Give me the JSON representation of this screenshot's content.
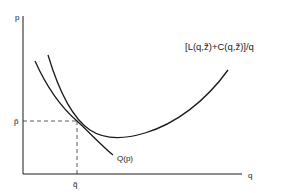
{
  "diagram": {
    "axes": {
      "y_label": "p",
      "x_label": "q"
    },
    "equilibrium": {
      "p_label": "p̃",
      "q_label": "q̃"
    },
    "curves": [
      {
        "id": "average-cost",
        "label": "[L(q,z̃)+C(q,z̃)]/q",
        "shape": "U-shaped"
      },
      {
        "id": "demand",
        "label": "Q(p)",
        "shape": "downward-sloping"
      }
    ],
    "colors": {
      "ink": "#1a1a1a",
      "background": "#ffffff"
    }
  }
}
